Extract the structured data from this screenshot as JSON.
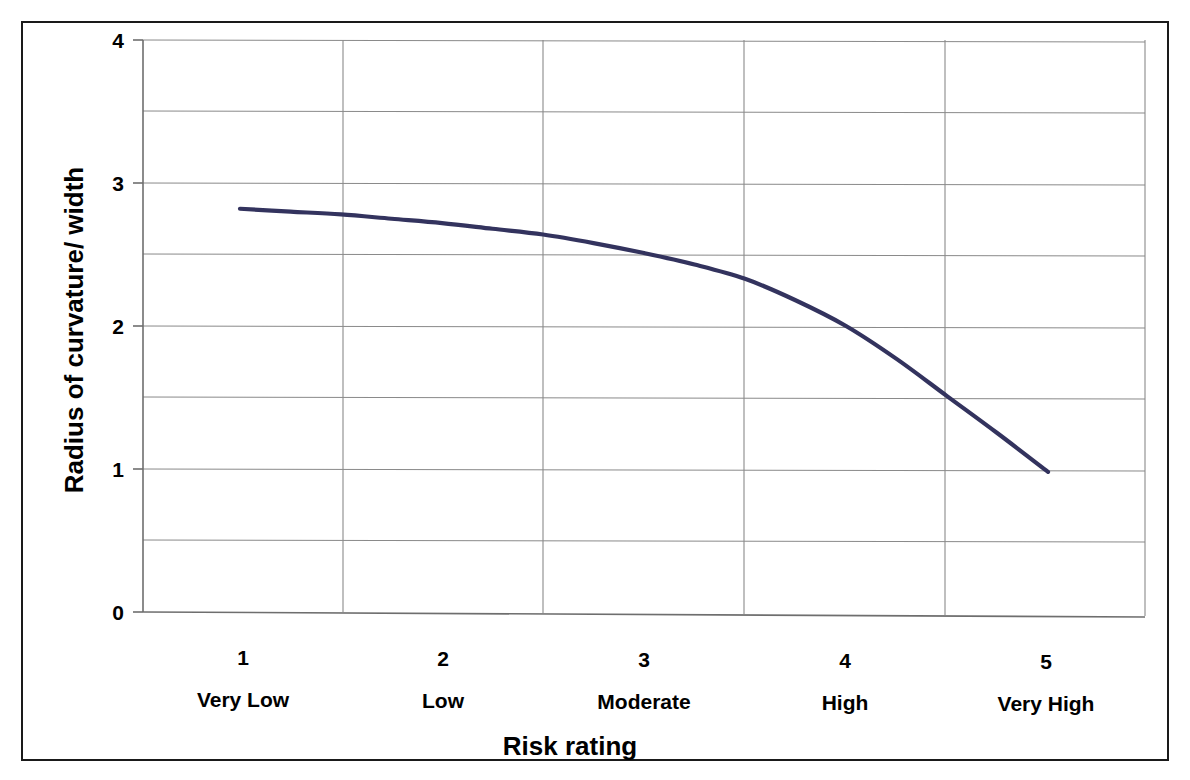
{
  "figure": {
    "background_color": "#ffffff",
    "frame_color": "#1a1a1a"
  },
  "chart_data": {
    "type": "line",
    "title": "",
    "xlabel": "Risk rating",
    "ylabel": "Radius of curvature/ width",
    "categories": [
      "1",
      "2",
      "3",
      "4",
      "5"
    ],
    "category_labels": [
      "Very Low",
      "Low",
      "Moderate",
      "High",
      "Very High"
    ],
    "series": [
      {
        "name": "Radius of curvature/ width",
        "color": "#33335e",
        "values": [
          2.82,
          2.72,
          2.51,
          2.0,
          0.98
        ]
      }
    ],
    "x": [
      1,
      2,
      3,
      4,
      5
    ],
    "dense_x": [
      1.0,
      1.25,
      1.5,
      1.75,
      2.0,
      2.25,
      2.5,
      2.75,
      3.0,
      3.25,
      3.5,
      3.75,
      4.0,
      4.25,
      4.5,
      4.75,
      5.0
    ],
    "dense_y": [
      2.82,
      2.8,
      2.78,
      2.75,
      2.72,
      2.68,
      2.64,
      2.58,
      2.51,
      2.43,
      2.33,
      2.18,
      2.0,
      1.77,
      1.51,
      1.25,
      0.98
    ],
    "ylim": [
      0,
      4
    ],
    "ytick_labels": [
      "0",
      "1",
      "2",
      "3",
      "4"
    ],
    "ytick_values": [
      0,
      1,
      2,
      3,
      4
    ],
    "gridline_values": [
      0.5,
      1.0,
      1.5,
      2.0,
      2.5,
      3.0,
      3.5,
      4.0
    ],
    "grid": true,
    "grid_color": "#808080",
    "legend": "none",
    "axis_color": "#808080"
  }
}
